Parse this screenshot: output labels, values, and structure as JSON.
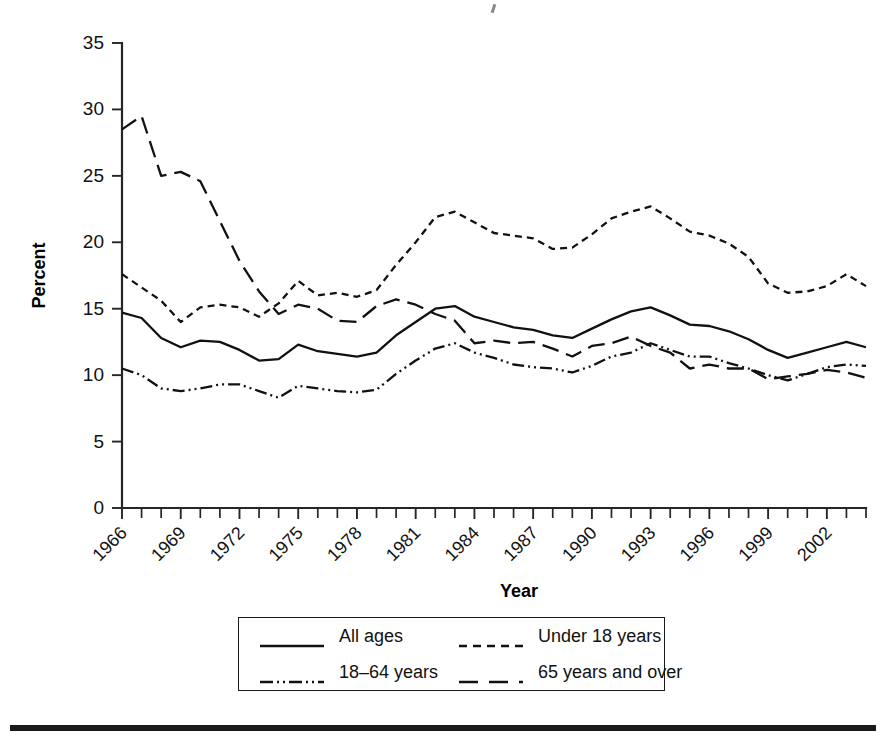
{
  "figure": {
    "background_color": "#ffffff",
    "ink_color": "#111111"
  },
  "axes": {
    "y_title": "Percent",
    "x_title": "Year",
    "y_ticks": [
      "0",
      "5",
      "10",
      "15",
      "20",
      "25",
      "30",
      "35"
    ],
    "x_ticks": [
      "1966",
      "1969",
      "1972",
      "1975",
      "1978",
      "1981",
      "1984",
      "1987",
      "1990",
      "1993",
      "1996",
      "1999",
      "2002"
    ]
  },
  "legend": {
    "items": [
      {
        "label": "All ages",
        "style": "solid",
        "sample": "solid-line-sample"
      },
      {
        "label": "Under 18 years",
        "style": "dashed",
        "sample": "dashed-line-sample"
      },
      {
        "label": "18–64 years",
        "style": "dash-dot-dot",
        "sample": "dash-dot-dot-line-sample"
      },
      {
        "label": "65 years and over",
        "style": "long-dash",
        "sample": "long-dash-line-sample"
      }
    ]
  },
  "chart_data": {
    "type": "line",
    "title": "",
    "subtitle": "",
    "xlabel": "Year",
    "ylabel": "Percent",
    "xlim": [
      1966,
      2004
    ],
    "ylim": [
      0,
      35
    ],
    "ytick_step": 5,
    "xtick_step": 1,
    "xtick_label_step": 3,
    "xtick_label_rotation": -45,
    "grid": false,
    "legend_position": "below-axes",
    "x": [
      1966,
      1967,
      1968,
      1969,
      1970,
      1971,
      1972,
      1973,
      1974,
      1975,
      1976,
      1977,
      1978,
      1979,
      1980,
      1981,
      1982,
      1983,
      1984,
      1985,
      1986,
      1987,
      1988,
      1989,
      1990,
      1991,
      1992,
      1993,
      1994,
      1995,
      1996,
      1997,
      1998,
      1999,
      2000,
      2001,
      2002,
      2003,
      2004
    ],
    "series": [
      {
        "name": "All ages",
        "style": "solid",
        "values": [
          14.7,
          14.3,
          12.8,
          12.1,
          12.6,
          12.5,
          11.9,
          11.1,
          11.2,
          12.3,
          11.8,
          11.6,
          11.4,
          11.7,
          13.0,
          14.0,
          15.0,
          15.2,
          14.4,
          14.0,
          13.6,
          13.4,
          13.0,
          12.8,
          13.5,
          14.2,
          14.8,
          15.1,
          14.5,
          13.8,
          13.7,
          13.3,
          12.7,
          11.9,
          11.3,
          11.7,
          12.1,
          12.5,
          12.1
        ]
      },
      {
        "name": "Under 18 years",
        "style": "dashed",
        "values": [
          17.6,
          16.6,
          15.6,
          14.0,
          15.1,
          15.3,
          15.1,
          14.4,
          15.4,
          17.1,
          16.0,
          16.2,
          15.9,
          16.4,
          18.3,
          20.0,
          21.9,
          22.3,
          21.5,
          20.7,
          20.5,
          20.3,
          19.5,
          19.6,
          20.6,
          21.8,
          22.3,
          22.7,
          21.8,
          20.8,
          20.5,
          19.9,
          18.9,
          16.9,
          16.2,
          16.3,
          16.7,
          17.6,
          16.7
        ]
      },
      {
        "name": "18–64 years",
        "style": "dash-dot-dot",
        "values": [
          10.5,
          10.0,
          9.0,
          8.8,
          9.0,
          9.3,
          9.3,
          8.8,
          8.3,
          9.2,
          9.0,
          8.8,
          8.7,
          8.9,
          10.1,
          11.1,
          12.0,
          12.4,
          11.7,
          11.3,
          10.8,
          10.6,
          10.5,
          10.2,
          10.7,
          11.4,
          11.7,
          12.4,
          11.9,
          11.4,
          11.4,
          10.9,
          10.5,
          10.0,
          9.6,
          10.1,
          10.6,
          10.8,
          10.7
        ]
      },
      {
        "name": "65 years and over",
        "style": "long-dash",
        "values": [
          28.5,
          29.5,
          25.0,
          25.3,
          24.6,
          21.6,
          18.6,
          16.3,
          14.6,
          15.3,
          15.0,
          14.1,
          14.0,
          15.2,
          15.7,
          15.3,
          14.6,
          14.1,
          12.4,
          12.6,
          12.4,
          12.5,
          12.0,
          11.4,
          12.2,
          12.4,
          12.9,
          12.2,
          11.7,
          10.5,
          10.8,
          10.5,
          10.5,
          9.7,
          9.9,
          10.1,
          10.4,
          10.2,
          9.8
        ]
      }
    ]
  }
}
